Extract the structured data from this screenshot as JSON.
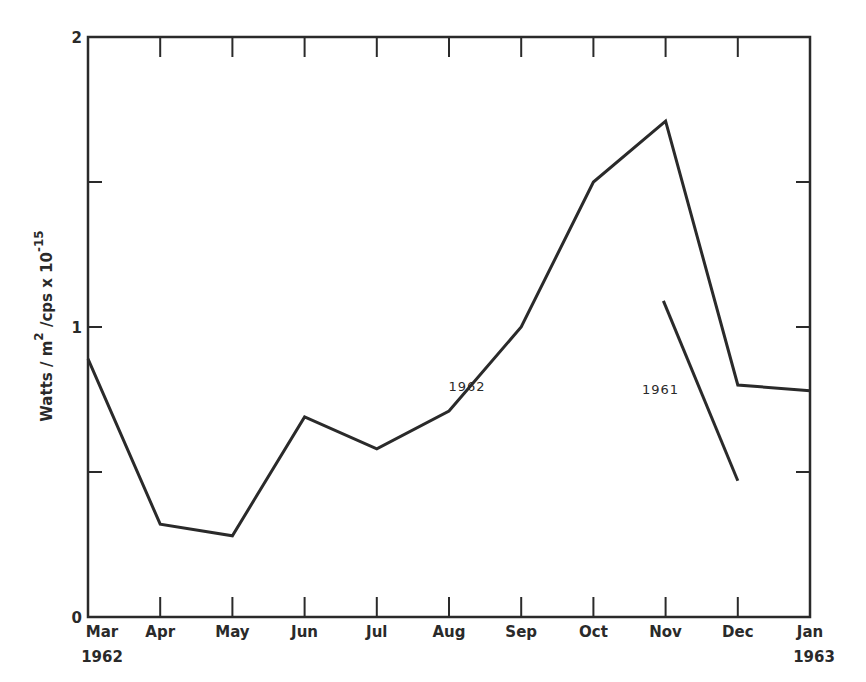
{
  "chart_data": {
    "type": "line",
    "title": "",
    "xlabel": "",
    "ylabel": "Watts / m² / cps x 10⁻¹⁵",
    "ylabel_parts": {
      "base": "Watts / m",
      "sup1": "2",
      "mid": " /cps x 10",
      "sup2": "-15"
    },
    "categories": [
      "Mar",
      "Apr",
      "May",
      "Jun",
      "Jul",
      "Aug",
      "Sep",
      "Oct",
      "Nov",
      "Dec",
      "Jan"
    ],
    "category_sublabels": {
      "0": "1962",
      "10": "1963"
    },
    "ylim": [
      0,
      2
    ],
    "yticks": [
      0,
      0.5,
      1,
      1.5,
      2
    ],
    "ytick_labels": {
      "0": "0",
      "1": "1",
      "2": "2"
    },
    "grid": false,
    "series": [
      {
        "name": "1962",
        "label_pos": {
          "x": 5.25,
          "y": 0.78
        },
        "points": [
          [
            0,
            0.89
          ],
          [
            1,
            0.32
          ],
          [
            2,
            0.28
          ],
          [
            3,
            0.69
          ],
          [
            4,
            0.58
          ],
          [
            5,
            0.71
          ],
          [
            6,
            1.0
          ],
          [
            7,
            1.5
          ],
          [
            8,
            1.71
          ],
          [
            9,
            0.8
          ],
          [
            10,
            0.78
          ]
        ]
      },
      {
        "name": "1961",
        "label_pos": {
          "x": 7.93,
          "y": 0.77
        },
        "points": [
          [
            7.97,
            1.09
          ],
          [
            9.0,
            0.47
          ]
        ]
      }
    ],
    "colors": {
      "line": "#2a2a2a",
      "axis": "#2a2a2a"
    }
  }
}
